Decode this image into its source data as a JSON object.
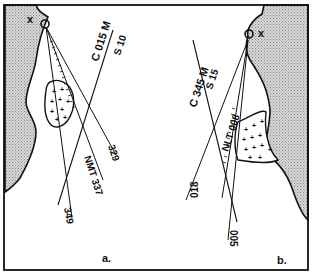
{
  "figure": {
    "colors": {
      "land": "#c8c8c8",
      "ink": "#111111",
      "background": "#ffffff"
    }
  },
  "panel_a": {
    "caption": "a.",
    "position_marker": "x",
    "lines": [
      {
        "label_top": "C 015 M",
        "label_bottom": "S 10"
      },
      {
        "label": "329"
      },
      {
        "label": "NMT 337"
      },
      {
        "label": "349"
      }
    ]
  },
  "panel_b": {
    "caption": "b.",
    "position_marker": "x",
    "lines": [
      {
        "label_top": "C 345 M",
        "label_bottom": "S 15"
      },
      {
        "label": "NLT 008"
      },
      {
        "label": "018"
      },
      {
        "label": "005"
      }
    ]
  }
}
